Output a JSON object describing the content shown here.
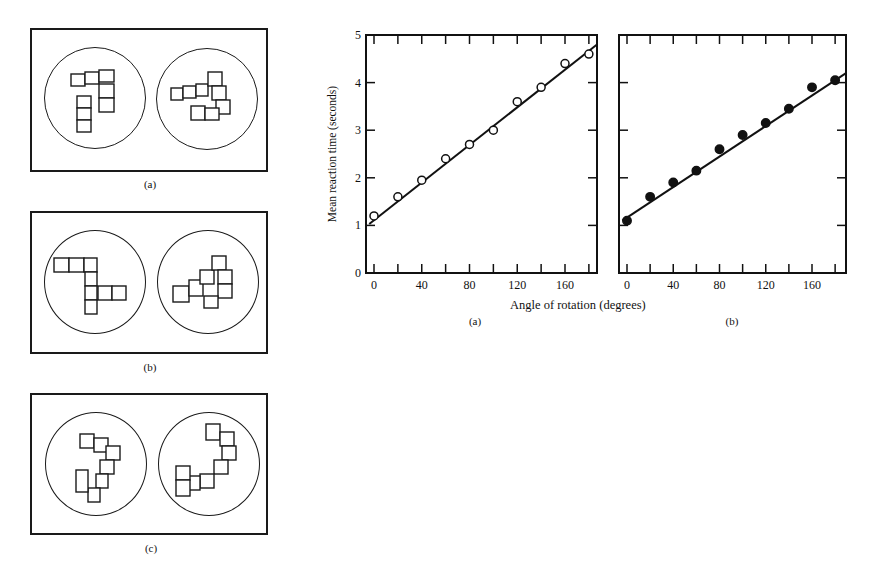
{
  "stimuli": {
    "panels": [
      {
        "id": "a",
        "caption": "(a)"
      },
      {
        "id": "b",
        "caption": "(b)"
      },
      {
        "id": "c",
        "caption": "(c)"
      }
    ]
  },
  "charts_meta": {
    "ylabel": "Mean reaction time (seconds)",
    "xlabel": "Angle of rotation (degrees)",
    "yticks": [
      "0",
      "1",
      "2",
      "3",
      "4",
      "5"
    ],
    "xticks": [
      "0",
      "40",
      "80",
      "120",
      "160"
    ],
    "caption_a": "(a)",
    "caption_b": "(b)"
  },
  "chart_data": [
    {
      "type": "scatter",
      "title": "(a)",
      "xlabel": "Angle of rotation (degrees)",
      "ylabel": "Mean reaction time (seconds)",
      "xlim": [
        -4,
        190
      ],
      "ylim": [
        0,
        5
      ],
      "xticks": [
        0,
        40,
        80,
        120,
        160
      ],
      "yticks": [
        0,
        1,
        2,
        3,
        4,
        5
      ],
      "grid": false,
      "marker": "open-circle",
      "x": [
        0,
        20,
        40,
        60,
        80,
        100,
        120,
        140,
        160,
        180
      ],
      "y": [
        1.2,
        1.6,
        1.95,
        2.4,
        2.7,
        3.0,
        3.6,
        3.9,
        4.4,
        4.6
      ],
      "fit_line": {
        "x": [
          -4,
          190
        ],
        "y": [
          1.03,
          4.8
        ]
      }
    },
    {
      "type": "scatter",
      "title": "(b)",
      "xlabel": "Angle of rotation (degrees)",
      "ylabel": "Mean reaction time (seconds)",
      "xlim": [
        -4,
        190
      ],
      "ylim": [
        0,
        5
      ],
      "xticks": [
        0,
        40,
        80,
        120,
        160
      ],
      "yticks": [
        0,
        1,
        2,
        3,
        4,
        5
      ],
      "grid": false,
      "marker": "filled-circle",
      "x": [
        0,
        20,
        40,
        60,
        80,
        100,
        120,
        140,
        160,
        180
      ],
      "y": [
        1.1,
        1.6,
        1.9,
        2.15,
        2.6,
        2.9,
        3.15,
        3.45,
        3.9,
        4.05
      ],
      "fit_line": {
        "x": [
          -4,
          190
        ],
        "y": [
          1.1,
          4.2
        ]
      }
    }
  ]
}
